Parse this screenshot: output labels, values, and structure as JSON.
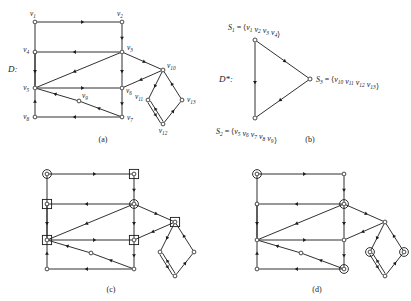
{
  "figure": {
    "title_left": "D:",
    "title_right": "D*:",
    "panels": [
      {
        "id": "a",
        "caption": "(a)"
      },
      {
        "id": "b",
        "caption": "(b)"
      },
      {
        "id": "c",
        "caption": "(c)"
      },
      {
        "id": "d",
        "caption": "(d)"
      }
    ]
  },
  "graph": {
    "vertex_labels": [
      "v1",
      "v2",
      "v3",
      "v4",
      "v5",
      "v6",
      "v7",
      "v8",
      "v9",
      "v10",
      "v11",
      "v12",
      "v13"
    ],
    "vertex_base": [
      "v",
      "v",
      "v",
      "v",
      "v",
      "v",
      "v",
      "v",
      "v",
      "v",
      "v",
      "v",
      "v"
    ],
    "vertex_sub": [
      "1",
      "2",
      "3",
      "4",
      "5",
      "6",
      "7",
      "8",
      "9",
      "10",
      "11",
      "12",
      "13"
    ],
    "nodes": [
      {
        "name": "v1",
        "x": 35,
        "y": 22,
        "label_dx": -2,
        "label_dy": -6,
        "anchor": "middle"
      },
      {
        "name": "v2",
        "x": 122,
        "y": 22,
        "label_dx": -2,
        "label_dy": -6,
        "anchor": "middle"
      },
      {
        "name": "v3",
        "x": 122,
        "y": 52,
        "label_dx": 5,
        "label_dy": -2,
        "anchor": "start"
      },
      {
        "name": "v4",
        "x": 35,
        "y": 52,
        "label_dx": -6,
        "label_dy": 0,
        "anchor": "end"
      },
      {
        "name": "v5",
        "x": 35,
        "y": 88,
        "label_dx": -6,
        "label_dy": 2,
        "anchor": "end"
      },
      {
        "name": "v6",
        "x": 122,
        "y": 88,
        "label_dx": 4,
        "label_dy": 5,
        "anchor": "start"
      },
      {
        "name": "v7",
        "x": 122,
        "y": 117,
        "label_dx": 5,
        "label_dy": 3,
        "anchor": "start"
      },
      {
        "name": "v8",
        "x": 35,
        "y": 117,
        "label_dx": -6,
        "label_dy": 2,
        "anchor": "end"
      },
      {
        "name": "v9",
        "x": 79,
        "y": 101,
        "label_dx": 3,
        "label_dy": -3,
        "anchor": "start"
      },
      {
        "name": "v10",
        "x": 163,
        "y": 70,
        "label_dx": 4,
        "label_dy": -2,
        "anchor": "start"
      },
      {
        "name": "v11",
        "x": 148,
        "y": 100,
        "label_dx": -5,
        "label_dy": -1,
        "anchor": "end"
      },
      {
        "name": "v12",
        "x": 163,
        "y": 124,
        "label_dx": 0,
        "label_dy": 9,
        "anchor": "middle"
      },
      {
        "name": "v13",
        "x": 182,
        "y": 100,
        "label_dx": 5,
        "label_dy": 2,
        "anchor": "start"
      }
    ],
    "edges": [
      {
        "from": "v1",
        "to": "v2",
        "kind": "straight"
      },
      {
        "from": "v2",
        "to": "v3",
        "kind": "straight"
      },
      {
        "from": "v3",
        "to": "v4",
        "kind": "straight"
      },
      {
        "from": "v4",
        "to": "v5",
        "kind": "straight"
      },
      {
        "from": "v5",
        "to": "v1",
        "kind": "straight"
      },
      {
        "from": "v3",
        "to": "v5",
        "kind": "straight"
      },
      {
        "from": "v3",
        "to": "v6",
        "kind": "straight"
      },
      {
        "from": "v5",
        "to": "v6",
        "kind": "straight"
      },
      {
        "from": "v6",
        "to": "v7",
        "kind": "straight"
      },
      {
        "from": "v7",
        "to": "v9",
        "kind": "straight"
      },
      {
        "from": "v9",
        "to": "v5",
        "kind": "straight"
      },
      {
        "from": "v7",
        "to": "v8",
        "kind": "straight"
      },
      {
        "from": "v8",
        "to": "v5",
        "kind": "straight"
      },
      {
        "from": "v3",
        "to": "v10",
        "kind": "straight"
      },
      {
        "from": "v10",
        "to": "v6",
        "kind": "straight"
      },
      {
        "from": "v10",
        "to": "v11",
        "kind": "straight"
      },
      {
        "from": "v11",
        "to": "v12",
        "kind": "double"
      },
      {
        "from": "v12",
        "to": "v13",
        "kind": "straight"
      },
      {
        "from": "v13",
        "to": "v10",
        "kind": "straight"
      }
    ]
  },
  "condensation": {
    "label": "D*:",
    "nodes": [
      {
        "name": "S1",
        "x": 255,
        "y": 40
      },
      {
        "name": "S2",
        "x": 255,
        "y": 118
      },
      {
        "name": "S3",
        "x": 310,
        "y": 79
      }
    ],
    "edges": [
      {
        "from": "S1",
        "to": "S2"
      },
      {
        "from": "S1",
        "to": "S3"
      },
      {
        "from": "S3",
        "to": "S2"
      }
    ],
    "sets": [
      {
        "name": "S1",
        "sub": "1",
        "eq": "=",
        "open": "<",
        "members": [
          "v1",
          "v2",
          "v3",
          "v4"
        ],
        "close": ">",
        "x": 228,
        "y": 30,
        "anchor": "start"
      },
      {
        "name": "S2",
        "sub": "2",
        "eq": "=",
        "open": "<",
        "members": [
          "v5",
          "v6",
          "v7",
          "v8",
          "v9"
        ],
        "close": ">",
        "x": 216,
        "y": 134,
        "anchor": "start"
      },
      {
        "name": "S3",
        "sub": "3",
        "eq": "=",
        "open": "<",
        "members": [
          "v10",
          "v11",
          "v12",
          "v13"
        ],
        "close": ">",
        "x": 316,
        "y": 82,
        "anchor": "start"
      }
    ]
  },
  "markers": {
    "panel_c": {
      "circle": [
        "v1",
        "v3"
      ],
      "square": [
        "v2",
        "v4",
        "v5",
        "v6",
        "v10"
      ]
    },
    "panel_d": {
      "circle": [
        "v1",
        "v3",
        "v7",
        "v11",
        "v13"
      ],
      "square": []
    }
  },
  "style": {
    "line_color": "#1a1a1a",
    "node_fill": "#ffffff",
    "background": "#ffffff"
  }
}
